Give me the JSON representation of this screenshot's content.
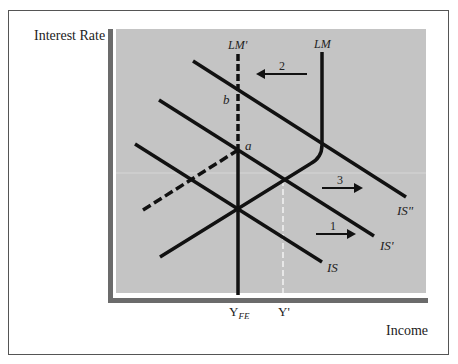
{
  "figure": {
    "y_axis_label": "Interest Rate",
    "x_axis_label": "Income",
    "x_ticks": [
      {
        "label": "Y",
        "sub": "FE"
      },
      {
        "label": "Y'",
        "sub": ""
      }
    ],
    "curves": {
      "lm": "LM",
      "lm_prime": "LM'",
      "is": "IS",
      "is_prime": "IS'",
      "is_double_prime": "IS\""
    },
    "points": {
      "a": "a",
      "b": "b"
    },
    "arrows": {
      "one": "1",
      "two": "2",
      "three": "3"
    },
    "colors": {
      "plot_bg": "#c4c4c4",
      "axis": "#6b6b6b",
      "line": "#111111"
    }
  }
}
